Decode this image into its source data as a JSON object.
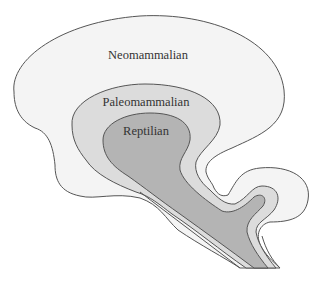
{
  "diagram": {
    "type": "triune-brain",
    "regions": [
      {
        "id": "neomammalian",
        "label": "Neomammalian",
        "color": "#f4f4f4"
      },
      {
        "id": "paleomammalian",
        "label": "Paleomammalian",
        "color": "#dcdcdc"
      },
      {
        "id": "reptilian",
        "label": "Reptilian",
        "color": "#b4b4b4"
      }
    ],
    "outline_color": "#555555"
  }
}
